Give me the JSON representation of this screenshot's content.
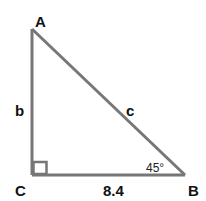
{
  "diagram": {
    "type": "right-triangle",
    "stroke_color": "#777777",
    "vertices": {
      "A": {
        "label": "A"
      },
      "B": {
        "label": "B"
      },
      "C": {
        "label": "C"
      }
    },
    "sides": {
      "a": {
        "label": "8.4",
        "between": "C-B"
      },
      "b": {
        "label": "b",
        "between": "A-C"
      },
      "c": {
        "label": "c",
        "between": "A-B"
      }
    },
    "angles": {
      "B": {
        "label": "45°"
      },
      "C": {
        "label": "right-angle-marker"
      }
    }
  }
}
